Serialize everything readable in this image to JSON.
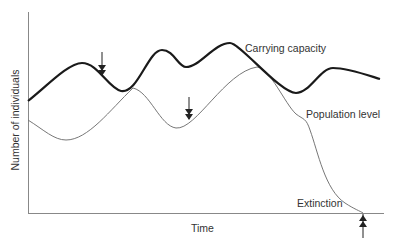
{
  "diagram": {
    "y_axis_label": "Number of individuals",
    "x_axis_label": "Time",
    "curves": [
      {
        "name": "Carrying capacity",
        "style": "thick",
        "color": "#1a1a1a"
      },
      {
        "name": "Population level",
        "style": "thin",
        "color": "#777777"
      }
    ],
    "labels": {
      "carrying_capacity": "Carrying capacity",
      "population_level": "Population level",
      "extinction": "Extinction"
    },
    "arrows": [
      {
        "name": "first-decline-marker",
        "direction": "down"
      },
      {
        "name": "second-decline-marker",
        "direction": "down"
      },
      {
        "name": "extinction-marker",
        "direction": "up"
      }
    ]
  }
}
